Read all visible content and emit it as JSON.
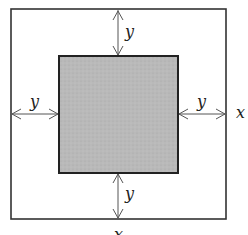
{
  "diagram": {
    "outer_square": {
      "side_label": "x"
    },
    "inner_square": {
      "fill": "#b8b8b8"
    },
    "labels": {
      "right_side": "x",
      "bottom_side": "x",
      "top_gap": "y",
      "bottom_gap": "y",
      "left_gap": "y",
      "right_gap": "y"
    }
  }
}
